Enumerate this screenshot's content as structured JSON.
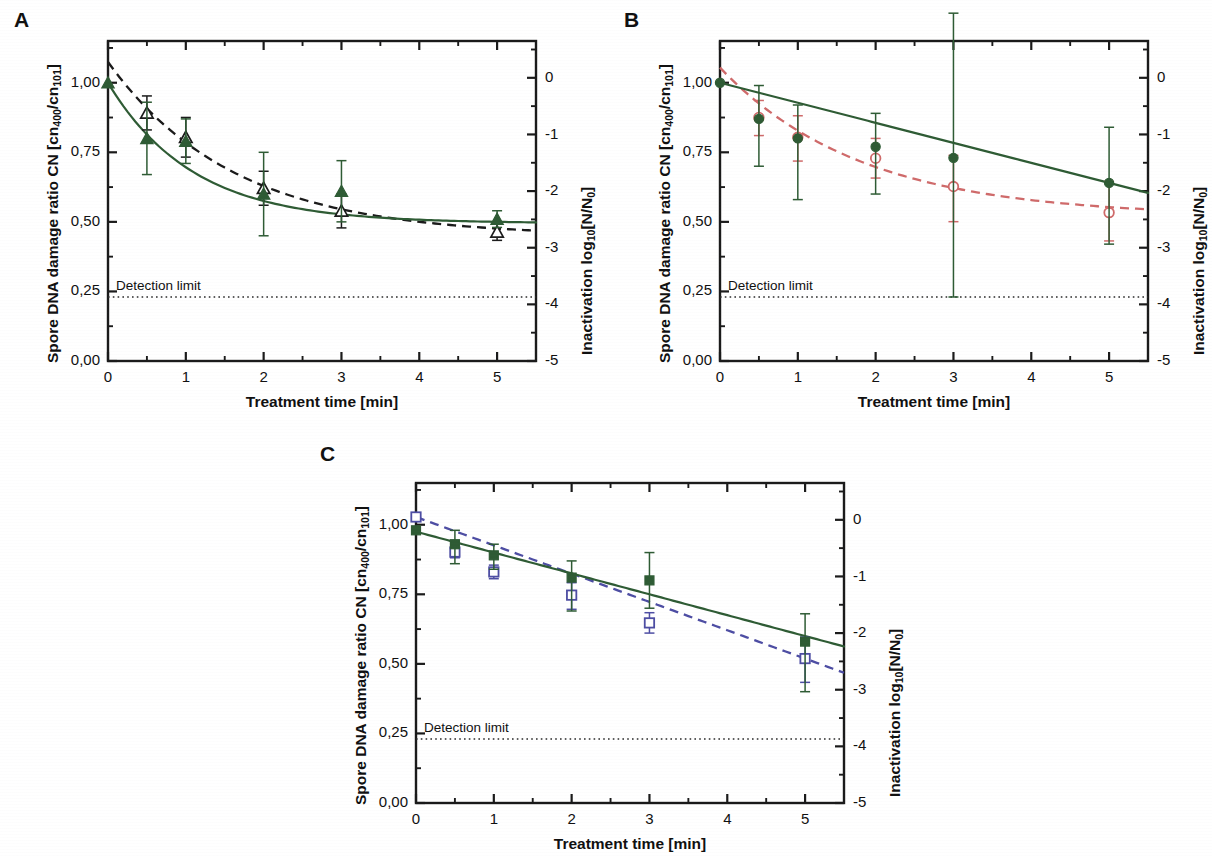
{
  "figure": {
    "axis_titles": {
      "y_left_pre": "Spore DNA damage ratio CN [cn",
      "y_left_sub1": "400",
      "y_left_mid": "/cn",
      "y_left_sub2": "101",
      "y_left_post": "]",
      "y_right_pre": "Inactivation log",
      "y_right_sub": "10",
      "y_right_post": "[N/N",
      "y_right_sub2": "0",
      "y_right_end": "]",
      "x": "Treatment time [min]"
    },
    "detection_limit_label": "Detection limit",
    "y_left_ticks": [
      "0,00",
      "0,25",
      "0,50",
      "0,75",
      "1,00"
    ],
    "y_left_tick_values": [
      0.0,
      0.25,
      0.5,
      0.75,
      1.0
    ],
    "y_right_ticks": [
      "-5",
      "-4",
      "-3",
      "-2",
      "-1",
      "0"
    ],
    "y_right_tick_values": [
      -5,
      -4,
      -3,
      -2,
      -1,
      0
    ],
    "x_ticks": [
      "0",
      "1",
      "2",
      "3",
      "4",
      "5"
    ],
    "x_tick_values": [
      0,
      1,
      2,
      3,
      4,
      5
    ],
    "colors": {
      "green": "#2e5b34",
      "black": "#1a1a1a",
      "red": "#cf6a6a",
      "blue": "#4d4da3",
      "axis": "#1a1a1a",
      "detection": "#2a2a2a"
    }
  },
  "chart_data": [
    {
      "type": "scatter",
      "panel": "A",
      "title": "A",
      "xlabel": "Treatment time [min]",
      "ylabel": "Spore DNA damage ratio CN [cn400/cn101]",
      "y2label": "Inactivation log10[N/N0]",
      "xlim": [
        0,
        5.5
      ],
      "ylim": [
        0,
        1.15
      ],
      "y2lim": [
        -5,
        0.65
      ],
      "grid": false,
      "legend": "none",
      "detection_limit": {
        "cn": 0.23,
        "log": -4.0,
        "label": "Detection limit"
      },
      "series": [
        {
          "name": "Spore DNA damage ratio CN",
          "marker": "filled-triangle",
          "color": "#2e5b34",
          "line": "solid",
          "axis": "left",
          "x": [
            0,
            0.5,
            1,
            2,
            3,
            5
          ],
          "values": [
            1.0,
            0.8,
            0.79,
            0.6,
            0.61,
            0.51
          ],
          "err_low": [
            0.0,
            0.13,
            0.08,
            0.15,
            0.11,
            0.03
          ],
          "err_high": [
            0.0,
            0.13,
            0.08,
            0.15,
            0.11,
            0.03
          ]
        },
        {
          "name": "Inactivation log10[N/N0]",
          "marker": "open-triangle",
          "color": "#1a1a1a",
          "line": "dashed",
          "axis": "right",
          "x": [
            0.5,
            1,
            2,
            3,
            5
          ],
          "values": [
            -0.62,
            -1.05,
            -1.95,
            -2.35,
            -2.72
          ],
          "err_low": [
            0.3,
            0.35,
            0.3,
            0.3,
            0.15
          ],
          "err_high": [
            0.3,
            0.35,
            0.3,
            0.3,
            0.15
          ]
        }
      ],
      "fit_left": {
        "y0": 1.0,
        "yinf": 0.495,
        "k": 0.92
      },
      "fit_right": {
        "y0": 0.28,
        "yinf": -2.8,
        "k": 0.62
      }
    },
    {
      "type": "scatter",
      "panel": "B",
      "title": "B",
      "xlabel": "Treatment time [min]",
      "ylabel": "Spore DNA damage ratio CN [cn400/cn101]",
      "y2label": "Inactivation log10[N/N0]",
      "xlim": [
        0,
        5.5
      ],
      "ylim": [
        0,
        1.15
      ],
      "y2lim": [
        -5,
        0.65
      ],
      "grid": false,
      "legend": "none",
      "detection_limit": {
        "cn": 0.23,
        "log": -4.0,
        "label": "Detection limit"
      },
      "series": [
        {
          "name": "Spore DNA damage ratio CN",
          "marker": "filled-circle",
          "color": "#2e5b34",
          "line": "solid",
          "axis": "left",
          "x": [
            0,
            0.5,
            1,
            2,
            3,
            5
          ],
          "values": [
            1.0,
            0.87,
            0.8,
            0.77,
            0.73,
            0.64
          ],
          "err_low": [
            0.0,
            0.17,
            0.22,
            0.17,
            0.5,
            0.22
          ],
          "err_high": [
            0.0,
            0.12,
            0.12,
            0.12,
            0.52,
            0.2
          ]
        },
        {
          "name": "Inactivation log10[N/N0]",
          "marker": "open-circle",
          "color": "#cf6a6a",
          "line": "dashed",
          "axis": "right",
          "x": [
            0.5,
            1,
            2,
            3,
            5
          ],
          "values": [
            -0.7,
            -1.05,
            -1.42,
            -1.92,
            -2.38
          ],
          "err_low": [
            0.32,
            0.42,
            0.35,
            0.62,
            0.5
          ],
          "err_high": [
            0.3,
            0.38,
            0.35,
            0.55,
            0.55
          ]
        }
      ],
      "fit_left": {
        "slope_linear": true,
        "y_at_0": 1.0,
        "y_at_5": 0.64
      },
      "fit_right": {
        "y0": 0.18,
        "yinf": -2.45,
        "k": 0.55
      }
    },
    {
      "type": "scatter",
      "panel": "C",
      "title": "C",
      "xlabel": "Treatment time [min]",
      "ylabel": "Spore DNA damage ratio CN [cn400/cn101]",
      "y2label": "Inactivation log10[N/N0]",
      "xlim": [
        0,
        5.5
      ],
      "ylim": [
        0,
        1.15
      ],
      "y2lim": [
        -5,
        0.65
      ],
      "grid": false,
      "legend": "none",
      "detection_limit": {
        "cn": 0.23,
        "log": -4.0,
        "label": "Detection limit"
      },
      "series": [
        {
          "name": "Spore DNA damage ratio CN",
          "marker": "filled-square",
          "color": "#2e5b34",
          "line": "solid",
          "axis": "left",
          "x": [
            0,
            0.5,
            1,
            2,
            3,
            5
          ],
          "values": [
            0.98,
            0.93,
            0.89,
            0.81,
            0.8,
            0.58
          ],
          "err_low": [
            0.0,
            0.07,
            0.05,
            0.12,
            0.1,
            0.18
          ],
          "err_high": [
            0.0,
            0.05,
            0.04,
            0.06,
            0.1,
            0.1
          ]
        },
        {
          "name": "Inactivation log10[N/N0]",
          "marker": "open-square",
          "color": "#4d4da3",
          "line": "dashed",
          "axis": "right",
          "x": [
            0,
            0.5,
            1,
            2,
            3,
            5
          ],
          "values": [
            0.05,
            -0.57,
            -0.92,
            -1.33,
            -1.82,
            -2.45
          ],
          "err_low": [
            0.0,
            0.1,
            0.12,
            0.25,
            0.18,
            0.42
          ],
          "err_high": [
            0.0,
            0.1,
            0.12,
            0.22,
            0.18,
            0.38
          ]
        }
      ],
      "fit_left": {
        "slope_linear": true,
        "y_at_0": 0.975,
        "y_at_5": 0.6
      },
      "fit_right": {
        "y0": 0.05,
        "yinf": -2.45,
        "linear": true
      }
    }
  ]
}
